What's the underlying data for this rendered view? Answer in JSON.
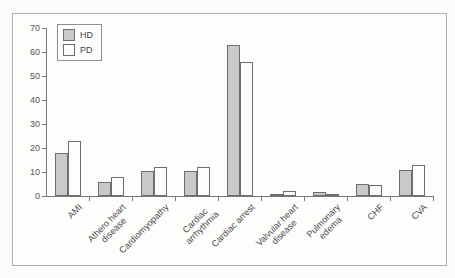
{
  "figure": {
    "background": "#fbfbfa",
    "frame_border_color": "#b0b0b0",
    "axis_color": "#777777",
    "text_color": "#4a4a4a"
  },
  "chart_data": {
    "type": "bar",
    "title": "",
    "xlabel": "",
    "ylabel": "",
    "categories": [
      "AMI",
      "Athero heart\ndisease",
      "Cardiomyopathy",
      "Cardiac\narrhythmia",
      "Cardiac arrest",
      "Valvular heart\ndisease",
      "Pulmonary\nedema",
      "CHF",
      "CVA"
    ],
    "series": [
      {
        "name": "HD",
        "color": "#c9c9c9",
        "values": [
          18,
          6,
          10.5,
          10.5,
          63,
          1,
          1.5,
          5,
          11
        ]
      },
      {
        "name": "PD",
        "color": "#fdfdfc",
        "values": [
          23,
          8,
          12,
          12,
          56,
          2,
          1,
          4.5,
          13
        ]
      }
    ],
    "ylim": [
      0,
      70
    ],
    "yticks": [
      0,
      10,
      20,
      30,
      40,
      50,
      60,
      70
    ],
    "grid": false,
    "legend_position": "top-left"
  }
}
